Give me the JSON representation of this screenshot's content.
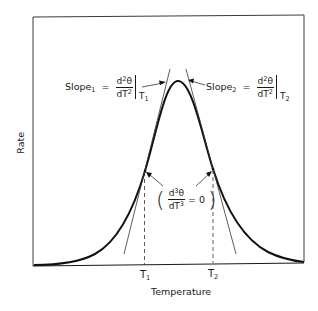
{
  "figure": {
    "y_axis_label": "Rate",
    "x_axis_label": "Temperature",
    "x_ticks": [
      {
        "main": "T",
        "sub": "1"
      },
      {
        "main": "T",
        "sub": "2"
      }
    ],
    "slope1": {
      "prefix": "Slope",
      "index": "1",
      "equals": "=",
      "num_d": "d",
      "num_exp": "2",
      "num_var": "θ",
      "den_d": "d",
      "den_var": "T",
      "den_exp": "2",
      "eval_main": "T",
      "eval_sub": "1"
    },
    "slope2": {
      "prefix": "Slope",
      "index": "2",
      "equals": "=",
      "num_d": "d",
      "num_exp": "2",
      "num_var": "θ",
      "den_d": "d",
      "den_var": "T",
      "den_exp": "2",
      "eval_main": "T",
      "eval_sub": "2"
    },
    "inflection": {
      "open": "(",
      "num_d": "d",
      "num_exp": "3",
      "num_var": "θ",
      "den_d": "d",
      "den_var": "T",
      "den_exp": "3",
      "equals": "= 0",
      "close": ")"
    },
    "colors": {
      "ink": "#1a1a1a",
      "background": "#ffffff"
    }
  }
}
